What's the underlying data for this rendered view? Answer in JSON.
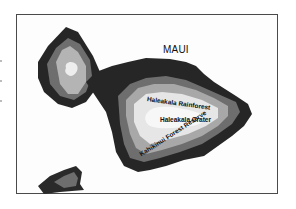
{
  "map": {
    "title": "MAUI",
    "labels": [
      {
        "id": "rainforest",
        "text": "Haleakala Rainforest"
      },
      {
        "id": "crater",
        "text": "Haleakala Crater"
      },
      {
        "id": "reserve",
        "text": "Kahikinui Forest Reserve"
      }
    ],
    "zones": {
      "coast": {
        "color": "#262626"
      },
      "mid": {
        "color": "#6e6e6e"
      },
      "upper": {
        "color": "#a8a8a8"
      },
      "summit": {
        "color": "#e6e6e6"
      },
      "peak": {
        "color": "#f5f5f5"
      }
    },
    "islands": [
      "West Maui",
      "East Maui (Haleakala)",
      "Kahoolawe fragment"
    ]
  }
}
